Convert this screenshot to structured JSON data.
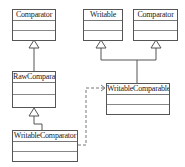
{
  "diagram": {
    "type": "uml-class-diagram",
    "classes": [
      {
        "id": "comparator_left",
        "name": "Comparator"
      },
      {
        "id": "writable",
        "name": "Writable"
      },
      {
        "id": "comparator_right",
        "name": "Comparator"
      },
      {
        "id": "raw_comparator",
        "name": "RawComparator"
      },
      {
        "id": "writable_comparable",
        "name": "WritableComparable"
      },
      {
        "id": "writable_comparator",
        "name": "WritableComparator"
      }
    ],
    "relations": [
      {
        "from": "RawComparator",
        "to": "Comparator",
        "kind": "generalization"
      },
      {
        "from": "WritableComparator",
        "to": "RawComparator",
        "kind": "generalization"
      },
      {
        "from": "WritableComparable",
        "to": "Writable",
        "kind": "generalization"
      },
      {
        "from": "WritableComparable",
        "to": "Comparator",
        "kind": "generalization"
      },
      {
        "from": "WritableComparator",
        "to": "WritableComparable",
        "kind": "dependency"
      }
    ]
  }
}
